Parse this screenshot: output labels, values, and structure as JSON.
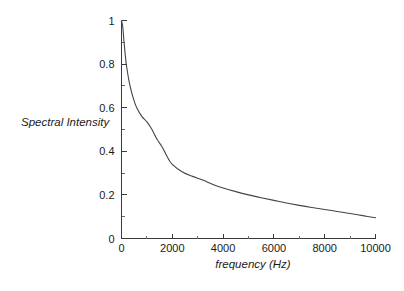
{
  "chart_data": {
    "type": "line",
    "title": "",
    "xlabel": "frequency (Hz)",
    "ylabel": "Spectral Intensity",
    "xlim": [
      0,
      10000
    ],
    "ylim": [
      0,
      1
    ],
    "grid": false,
    "legend": null,
    "xticks": [
      0,
      2000,
      4000,
      6000,
      8000,
      10000
    ],
    "xtick_labels": [
      "0",
      "2000",
      "4000",
      "6000",
      "8000",
      "10000"
    ],
    "yticks": [
      0,
      0.2,
      0.4,
      0.6,
      0.8,
      1
    ],
    "ytick_labels": [
      "0",
      "0.2",
      "0.4",
      "0.6",
      "0.8",
      "1"
    ],
    "x_minor_ticks": [
      1000,
      3000,
      5000,
      7000,
      9000
    ],
    "y_minor_ticks": [
      0.1,
      0.3,
      0.5,
      0.7,
      0.9
    ],
    "series": [
      {
        "name": "Spectral Intensity",
        "color": "#444444",
        "x": [
          0,
          50,
          100,
          150,
          200,
          300,
          400,
          500,
          600,
          800,
          1000,
          1200,
          1400,
          1600,
          1800,
          2000,
          2400,
          2800,
          3200,
          3600,
          4000,
          4500,
          5000,
          5500,
          6000,
          6500,
          7000,
          7500,
          8000,
          8500,
          9000,
          9500,
          10000
        ],
        "values": [
          1.0,
          0.97,
          0.9,
          0.84,
          0.79,
          0.72,
          0.67,
          0.63,
          0.6,
          0.56,
          0.535,
          0.5,
          0.455,
          0.42,
          0.375,
          0.34,
          0.305,
          0.285,
          0.268,
          0.248,
          0.232,
          0.215,
          0.2,
          0.187,
          0.175,
          0.163,
          0.152,
          0.142,
          0.133,
          0.124,
          0.115,
          0.105,
          0.095
        ]
      }
    ]
  },
  "axes": {
    "y_title": "Spectral Intensity",
    "x_title": "frequency (Hz)"
  }
}
